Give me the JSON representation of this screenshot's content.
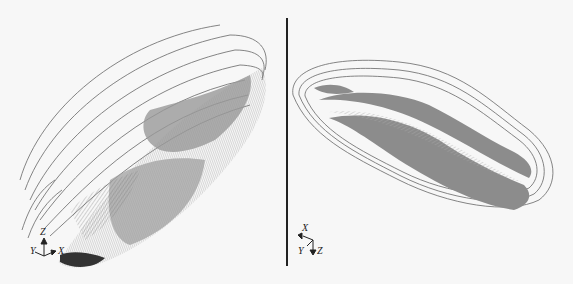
{
  "figure": {
    "type": "two-panel 3D pit model",
    "left_panel": {
      "description": "Oblique 3D view of open-pit surface with contour lines and shaded wireframe mesh",
      "axes": {
        "z": "Z",
        "y": "Y",
        "x": "X"
      }
    },
    "right_panel": {
      "description": "Top-down view of elongated pit with concentric benches and shaded mesh",
      "axes": {
        "x": "X",
        "y": "Y",
        "z": "Z"
      }
    },
    "colors": {
      "background": "#f7f7f7",
      "contour": "#555555",
      "mesh_dark": "#7a7a7a",
      "mesh_light": "#c8c8c8",
      "divider": "#222222"
    }
  }
}
